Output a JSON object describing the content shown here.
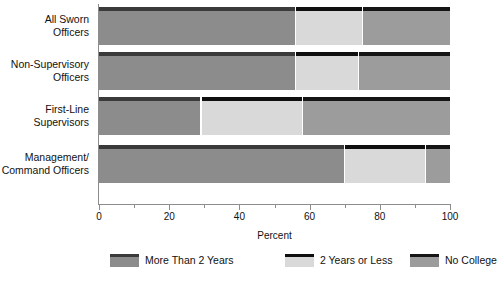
{
  "chart_data": {
    "type": "bar",
    "orientation": "horizontal",
    "stacked": true,
    "title": "",
    "xlabel": "Percent",
    "ylabel": "",
    "xlim": [
      0,
      100
    ],
    "grid": false,
    "legend_position": "bottom",
    "categories": [
      "All Sworn\nOfficers",
      "Non-Supervisory\nOfficers",
      "First-Line\nSupervisors",
      "Management/\nCommand Officers"
    ],
    "tick_labels": [
      "0",
      "20",
      "40",
      "60",
      "80",
      "100"
    ],
    "tick_values": [
      0,
      20,
      40,
      60,
      80,
      100
    ],
    "minor_tick_values": [
      10,
      30,
      50,
      70,
      90
    ],
    "series": [
      {
        "name": "More Than 2 Years",
        "color": "#8c8c8c",
        "cap_color": "#3a3a3a",
        "values": [
          56,
          56,
          29,
          70
        ]
      },
      {
        "name": "2 Years or Less",
        "color": "#d9d9d9",
        "cap_color": "#0f0f0f",
        "values": [
          19,
          18,
          29,
          23
        ]
      },
      {
        "name": "No College",
        "color": "#9c9c9c",
        "cap_color": "#151515",
        "values": [
          25,
          26,
          42,
          7
        ]
      }
    ]
  },
  "axis": {
    "xlabel": "Percent"
  },
  "colors": {
    "axis": "#8d8d8d",
    "text": "#111111",
    "background": "#ffffff"
  }
}
